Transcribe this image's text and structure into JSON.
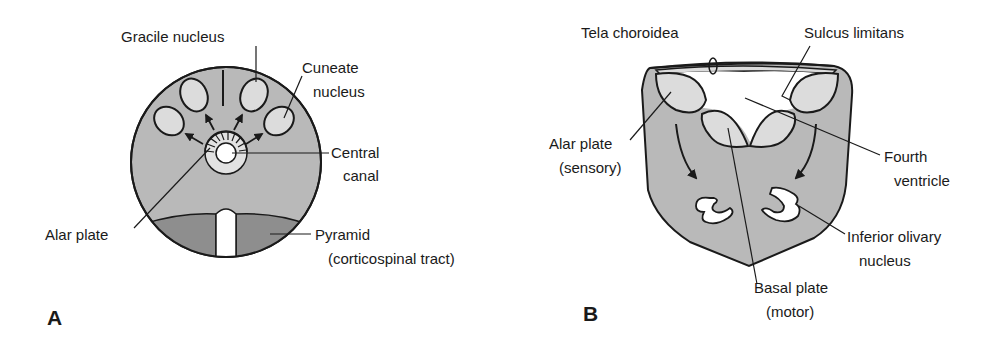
{
  "figure": {
    "panels": [
      {
        "id": "A",
        "letter": "A",
        "labels": {
          "gracile": "Gracile nucleus",
          "cuneate_1": "Cuneate",
          "cuneate_2": "nucleus",
          "central_1": "Central",
          "central_2": "canal",
          "alar": "Alar plate",
          "pyramid_1": "Pyramid",
          "pyramid_2": "(corticospinal tract)"
        }
      },
      {
        "id": "B",
        "letter": "B",
        "labels": {
          "tela": "Tela choroidea",
          "sulcus": "Sulcus limitans",
          "alar_1": "Alar plate",
          "alar_2": "(sensory)",
          "fourth_1": "Fourth",
          "fourth_2": "ventricle",
          "olivary_1": "Inferior olivary",
          "olivary_2": "nucleus",
          "basal_1": "Basal plate",
          "basal_2": "(motor)"
        }
      }
    ],
    "colors": {
      "tissue": "#b9b9b9",
      "pyramid": "#8e8e8e",
      "nucleus": "#dcdcdc",
      "outline": "#1a1a1a",
      "background": "#ffffff"
    }
  }
}
